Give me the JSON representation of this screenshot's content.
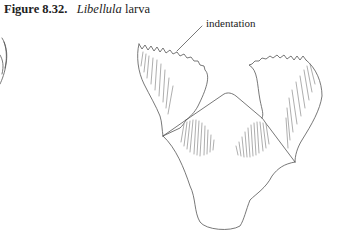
{
  "figure": {
    "number": "Figure 8.32.",
    "genus": "Libellula",
    "stage": "larva"
  },
  "annotations": [
    {
      "label": "indentation"
    }
  ]
}
